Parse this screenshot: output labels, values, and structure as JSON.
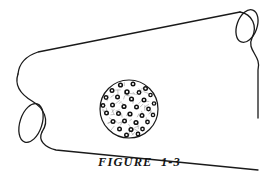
{
  "figure": {
    "caption": "FIGURE  1-3",
    "caption_label": "FIGURE",
    "caption_number": "1-3",
    "background_color": "#ffffff",
    "line_color": "#1a1a1a",
    "detail_color": "#111111",
    "speckle_color": "#9a9a9a"
  },
  "cylinder": {
    "name": "tube-body",
    "stroke_width": 1.3,
    "top_edge": "M 18,74 C 19,64 26,56 38,52 L 240,12",
    "bottom_edge": "M 42,132 C 38,140 44,147 56,150 L 258,170",
    "left_cap_path": "M 18,74 C 14,86 22,95 32,101 C 44,108 50,120 42,132",
    "right_cap_path": "M 240,12 C 252,14 258,26 252,38 C 246,50 262,56 258,70 L 258,118",
    "left_opening_ellipse": {
      "cx": 31,
      "cy": 123,
      "rx": 11,
      "ry": 20,
      "rotation_deg": 18
    },
    "right_opening_ellipse": {
      "cx": 247,
      "cy": 26,
      "rx": 10,
      "ry": 17,
      "rotation_deg": 20
    }
  },
  "inset": {
    "name": "magnified-cross-section",
    "shape": "circle",
    "cx": 129,
    "cy": 109,
    "r": 29,
    "stroke_width": 1.2,
    "description": "dense packing of round cells each drawn as a dark ring with light center, interspersed with fine light speckles",
    "cell_count": 42,
    "speckle_count": 60,
    "cells": [
      {
        "x": 120.5,
        "y": 85.0,
        "r": 2.6
      },
      {
        "x": 133.0,
        "y": 84.0,
        "r": 2.5
      },
      {
        "x": 145.5,
        "y": 88.5,
        "r": 2.5
      },
      {
        "x": 112.0,
        "y": 90.5,
        "r": 2.5
      },
      {
        "x": 127.0,
        "y": 92.0,
        "r": 2.7
      },
      {
        "x": 139.0,
        "y": 92.5,
        "r": 2.4
      },
      {
        "x": 150.5,
        "y": 95.0,
        "r": 2.3
      },
      {
        "x": 106.0,
        "y": 97.5,
        "r": 2.4
      },
      {
        "x": 117.5,
        "y": 97.0,
        "r": 2.5
      },
      {
        "x": 131.5,
        "y": 99.0,
        "r": 2.6
      },
      {
        "x": 144.0,
        "y": 100.0,
        "r": 2.5
      },
      {
        "x": 154.0,
        "y": 103.5,
        "r": 2.3
      },
      {
        "x": 103.0,
        "y": 105.5,
        "r": 2.4
      },
      {
        "x": 112.5,
        "y": 105.0,
        "r": 2.5
      },
      {
        "x": 124.0,
        "y": 106.5,
        "r": 2.6
      },
      {
        "x": 136.5,
        "y": 107.0,
        "r": 2.5
      },
      {
        "x": 148.5,
        "y": 109.0,
        "r": 2.4
      },
      {
        "x": 106.5,
        "y": 113.0,
        "r": 2.5
      },
      {
        "x": 118.5,
        "y": 113.5,
        "r": 2.5
      },
      {
        "x": 130.0,
        "y": 114.0,
        "r": 2.6
      },
      {
        "x": 142.0,
        "y": 115.5,
        "r": 2.5
      },
      {
        "x": 153.0,
        "y": 115.0,
        "r": 2.3
      },
      {
        "x": 103.5,
        "y": 120.5,
        "r": 2.3
      },
      {
        "x": 113.0,
        "y": 121.5,
        "r": 2.5
      },
      {
        "x": 124.5,
        "y": 121.0,
        "r": 2.5
      },
      {
        "x": 136.0,
        "y": 122.5,
        "r": 2.6
      },
      {
        "x": 147.5,
        "y": 122.0,
        "r": 2.4
      },
      {
        "x": 108.5,
        "y": 128.5,
        "r": 2.4
      },
      {
        "x": 119.5,
        "y": 129.0,
        "r": 2.5
      },
      {
        "x": 131.0,
        "y": 129.5,
        "r": 2.6
      },
      {
        "x": 142.5,
        "y": 129.0,
        "r": 2.4
      },
      {
        "x": 151.5,
        "y": 127.0,
        "r": 2.2
      },
      {
        "x": 115.0,
        "y": 134.5,
        "r": 2.3
      },
      {
        "x": 126.5,
        "y": 135.0,
        "r": 2.5
      },
      {
        "x": 138.0,
        "y": 134.0,
        "r": 2.4
      },
      {
        "x": 147.0,
        "y": 133.0,
        "r": 2.2
      },
      {
        "x": 126.0,
        "y": 80.5,
        "r": 2.2
      },
      {
        "x": 139.5,
        "y": 82.0,
        "r": 2.2
      },
      {
        "x": 156.0,
        "y": 109.5,
        "r": 2.2
      },
      {
        "x": 102.0,
        "y": 112.5,
        "r": 2.2
      },
      {
        "x": 121.0,
        "y": 139.0,
        "r": 2.1
      },
      {
        "x": 133.5,
        "y": 139.5,
        "r": 2.1
      }
    ]
  }
}
